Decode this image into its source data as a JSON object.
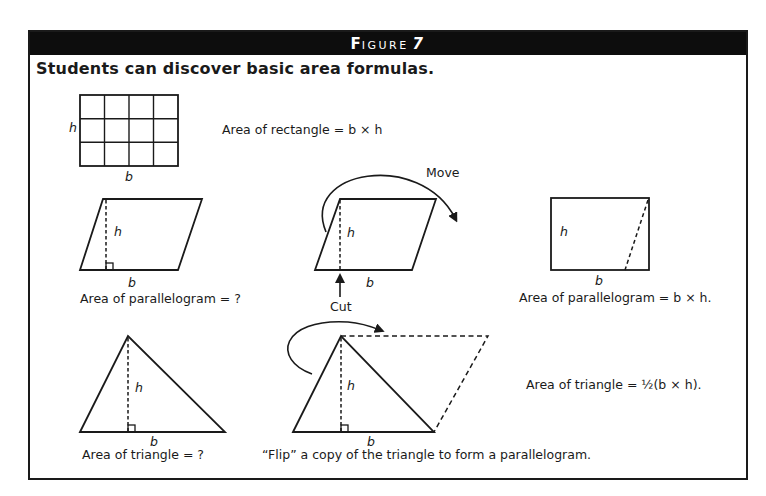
{
  "figure": {
    "label_first_letter": "F",
    "label_rest": "IGURE",
    "number": "7",
    "title": "Students can discover basic area formulas."
  },
  "rectangle_row": {
    "h_label": "h",
    "b_label": "b",
    "formula": "Area of rectangle = b × h",
    "grid": {
      "columns": 4,
      "rows": 3
    }
  },
  "parallelogram_row": {
    "panel1": {
      "h_label": "h",
      "b_label": "b",
      "caption": "Area of parallelogram = ?"
    },
    "panel2": {
      "h_label": "h",
      "b_label": "b",
      "move_label": "Move",
      "cut_label": "Cut"
    },
    "panel3": {
      "h_label": "h",
      "b_label": "b",
      "caption": "Area of parallelogram = b × h."
    }
  },
  "triangle_row": {
    "panel1": {
      "h_label": "h",
      "b_label": "b",
      "caption": "Area of triangle = ?"
    },
    "panel2": {
      "h_label": "h",
      "b_label": "b",
      "caption": "“Flip” a copy of the triangle to form a parallelogram."
    },
    "panel3": {
      "formula": "Area of triangle = ½(b × h)."
    }
  },
  "colors": {
    "ink": "#1a1a1a",
    "header_bg": "#0d0d0d",
    "header_text": "#ffffff",
    "background": "#ffffff"
  }
}
